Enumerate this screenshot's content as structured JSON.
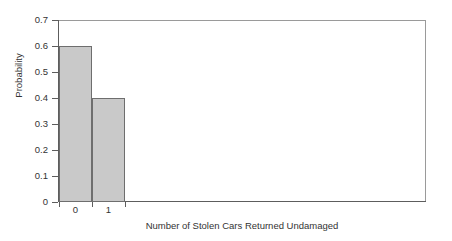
{
  "chart_data": {
    "type": "bar",
    "title": "",
    "subtitle": "",
    "xlabel": "Number of Stolen Cars Returned Undamaged",
    "ylabel": "Probability",
    "categories": [
      "0",
      "1"
    ],
    "values": [
      0.6,
      0.4
    ],
    "series": [
      {
        "name": "Probability",
        "values": [
          0.6,
          0.4
        ]
      }
    ],
    "ylim": [
      0,
      0.7
    ],
    "y_ticks": [
      "0",
      "0.1",
      "0.2",
      "0.3",
      "0.4",
      "0.5",
      "0.6",
      "0.7"
    ],
    "y_tick_values": [
      0,
      0.1,
      0.2,
      0.3,
      0.4,
      0.5,
      0.6,
      0.7
    ],
    "x_tick_labels": [
      "0",
      "1"
    ],
    "grid": false,
    "legend": false,
    "legend_position": "none",
    "annotations": [],
    "colors": {
      "bar_fill": "#c9c9c9",
      "bar_border": "#6e6e6e",
      "axis": "#5d5d5d",
      "frame": "#9a9a9a",
      "text": "#333333",
      "background": "#ffffff"
    }
  }
}
